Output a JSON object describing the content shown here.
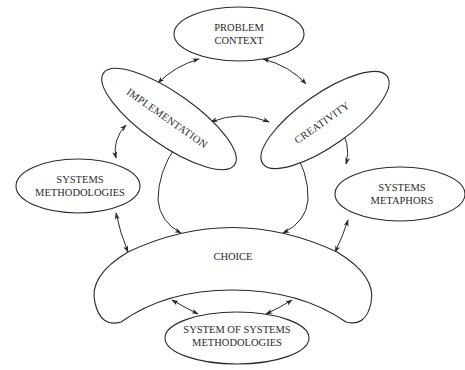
{
  "diagram": {
    "nodes": {
      "problem_context": {
        "line1": "PROBLEM",
        "line2": "CONTEXT"
      },
      "implementation": {
        "label": "IMPLEMENTATION"
      },
      "creativity": {
        "label": "CREATIVITY"
      },
      "systems_methodologies": {
        "line1": "SYSTEMS",
        "line2": "METHODOLOGIES"
      },
      "systems_metaphors": {
        "line1": "SYSTEMS",
        "line2": "METAPHORS"
      },
      "choice": {
        "label": "CHOICE"
      },
      "system_of_systems_methodologies": {
        "line1": "SYSTEM OF SYSTEMS",
        "line2": "METHODOLOGIES"
      }
    },
    "edges": [
      {
        "from": "problem_context",
        "to": "implementation",
        "type": "bidirectional"
      },
      {
        "from": "problem_context",
        "to": "creativity",
        "type": "bidirectional"
      },
      {
        "from": "implementation",
        "to": "creativity",
        "type": "bidirectional"
      },
      {
        "from": "implementation",
        "to": "systems_methodologies",
        "type": "bidirectional"
      },
      {
        "from": "creativity",
        "to": "systems_metaphors",
        "type": "bidirectional"
      },
      {
        "from": "implementation",
        "to": "choice",
        "type": "bidirectional"
      },
      {
        "from": "creativity",
        "to": "choice",
        "type": "bidirectional"
      },
      {
        "from": "systems_methodologies",
        "to": "choice",
        "type": "bidirectional"
      },
      {
        "from": "systems_metaphors",
        "to": "choice",
        "type": "bidirectional"
      },
      {
        "from": "choice",
        "to": "system_of_systems_methodologies",
        "type": "bidirectional",
        "count": 2
      }
    ]
  }
}
